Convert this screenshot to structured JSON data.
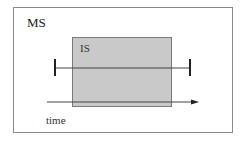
{
  "diagram": {
    "outer_label": "MS",
    "inner_label": "IS",
    "axis_label": "time",
    "colors": {
      "outer_border": "#8a8a8a",
      "inner_fill": "#c9c9c9",
      "inner_border": "#7a7a7a",
      "line": "#333333"
    }
  }
}
